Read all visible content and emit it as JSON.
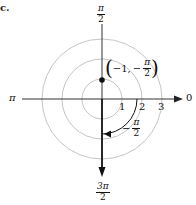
{
  "figure": {
    "part_label": "c.",
    "pole": {
      "x": 102,
      "y": 99
    },
    "unit_px": 20,
    "circles": [
      {
        "r": 1,
        "color": "#bdbdbd"
      },
      {
        "r": 2,
        "color": "#bdbdbd"
      },
      {
        "r": 3,
        "color": "#bdbdbd"
      }
    ],
    "axis_labels": {
      "top": {
        "num": "π",
        "den": "2"
      },
      "left": "π",
      "right": "0",
      "bottom": {
        "num": "3π",
        "den": "2"
      }
    },
    "radial_ticks": [
      "1",
      "2",
      "3"
    ],
    "point": {
      "label_r": "−1,",
      "label_theta_sign": "−",
      "label_theta": {
        "num": "π",
        "den": "2"
      },
      "r": -1,
      "theta": "-π/2",
      "color": "#111111"
    },
    "angle_arc": {
      "label_sign": "−",
      "label": {
        "num": "π",
        "den": "2"
      },
      "from_deg": 0,
      "to_deg": -90,
      "radius": 1.75
    },
    "ray_direction": "3π/2"
  }
}
